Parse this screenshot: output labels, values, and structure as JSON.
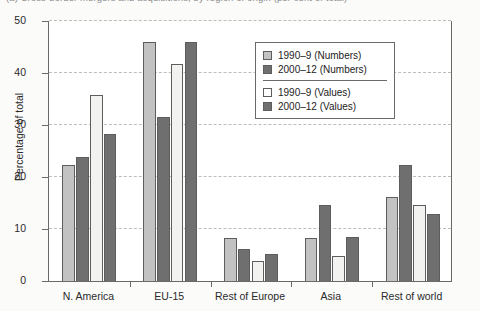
{
  "caption": {
    "text": "(a) Cross-border mergers and acquisitions, by region of origin (per cent of total)"
  },
  "chart_data": {
    "type": "bar",
    "title": "",
    "xlabel": "",
    "ylabel": "Percentage of total",
    "ylim": [
      0,
      50
    ],
    "yticks": [
      0,
      10,
      20,
      30,
      40,
      50
    ],
    "grid": true,
    "legend_position": "top-right",
    "categories": [
      "N. America",
      "EU-15",
      "Rest of Europe",
      "Asia",
      "Rest of world"
    ],
    "series": [
      {
        "name": "1990–9 (Numbers)",
        "color": "#c2c2c2",
        "values": [
          22.4,
          46.0,
          8.2,
          8.2,
          16.1
        ]
      },
      {
        "name": "2000–12 (Numbers)",
        "color": "#6f6f6f",
        "values": [
          23.8,
          31.6,
          6.2,
          14.7,
          22.3
        ]
      },
      {
        "name": "1990–9 (Values)",
        "color": "#ffffff",
        "values": [
          35.8,
          41.8,
          3.8,
          4.9,
          14.6
        ]
      },
      {
        "name": "2000–12 (Values)",
        "color": "#6f6f6f",
        "values": [
          28.3,
          46.1,
          5.2,
          8.4,
          12.9
        ]
      }
    ]
  },
  "legend": {
    "items": [
      {
        "label": "1990–9 (Numbers)"
      },
      {
        "label": "2000–12 (Numbers)"
      },
      {
        "label": "1990–9 (Values)"
      },
      {
        "label": "2000–12 (Values)"
      }
    ]
  }
}
